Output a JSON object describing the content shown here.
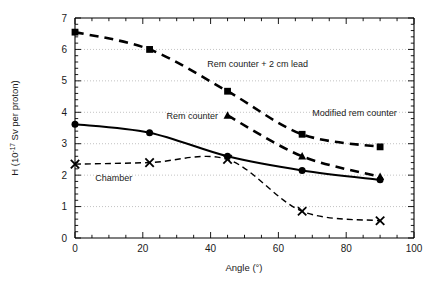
{
  "chart_data": {
    "type": "line",
    "title": "",
    "xlabel": "Angle (°)",
    "ylabel_parts": {
      "prefix": "H (10",
      "exponent": "-17",
      "suffix": " Sv per proton)"
    },
    "ylabel": "H (10-17 Sv per proton)",
    "xlim": [
      0,
      100
    ],
    "ylim": [
      0,
      7
    ],
    "xticks": [
      0,
      20,
      40,
      60,
      80,
      100
    ],
    "xtick_labels": [
      "0",
      "20",
      "40",
      "60",
      "80",
      "100"
    ],
    "yticks": [
      0,
      1,
      2,
      3,
      4,
      5,
      6,
      7
    ],
    "ytick_labels": [
      "0",
      "1",
      "2",
      "3",
      "4",
      "5",
      "6",
      "7"
    ],
    "x_minor_tick_interval": 5,
    "y_minor_tick_interval": 0.2,
    "grid": "horizontal-dotted-at-major-y",
    "legend_position": "inline-annotations",
    "series": [
      {
        "name": "Rem counter + 2 cm lead",
        "marker": "square",
        "linestyle": "dashed",
        "linewidth": 2.6,
        "color": "#000000",
        "x": [
          0,
          22,
          45,
          67,
          90
        ],
        "values": [
          6.55,
          6.0,
          4.67,
          3.3,
          2.9
        ],
        "label_text": "Rem counter + 2 cm lead",
        "label_x": 39,
        "label_y": 5.45
      },
      {
        "name": "Modified rem counter",
        "marker": "triangle",
        "linestyle": "dashed",
        "linewidth": 2.6,
        "color": "#000000",
        "x": [
          45,
          67,
          90
        ],
        "values": [
          3.9,
          2.6,
          1.95
        ],
        "label_text": "Modified rem counter",
        "label_x": 70,
        "label_y": 3.88
      },
      {
        "name": "Rem counter",
        "marker": "circle",
        "linestyle": "solid",
        "linewidth": 2.0,
        "color": "#000000",
        "x": [
          0,
          22,
          45,
          67,
          90
        ],
        "values": [
          3.62,
          3.35,
          2.6,
          2.15,
          1.85
        ],
        "label_text": "Rem counter",
        "label_x": 27,
        "label_y": 3.78
      },
      {
        "name": "Chamber",
        "marker": "x",
        "linestyle": "dashed-thin",
        "linewidth": 1.4,
        "color": "#000000",
        "x": [
          0,
          22,
          45,
          67,
          90
        ],
        "values": [
          2.35,
          2.4,
          2.5,
          0.85,
          0.55
        ],
        "label_text": "Chamber",
        "label_x": 6,
        "label_y": 1.82
      }
    ]
  },
  "figure": {
    "background_color": "#ffffff",
    "axis_color": "#000000",
    "grid_color": "#b4b4b4"
  }
}
